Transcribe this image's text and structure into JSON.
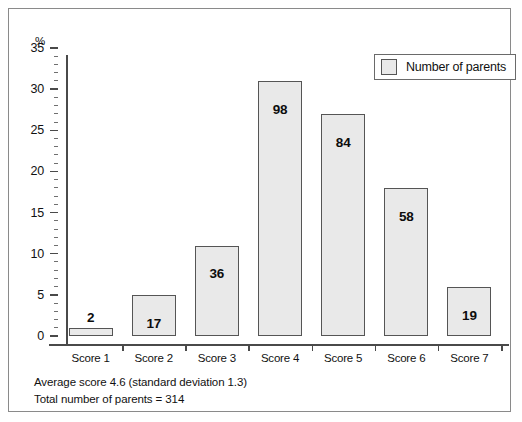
{
  "chart_data": {
    "type": "bar",
    "title": "",
    "subtitle": "",
    "xlabel": "",
    "ylabel": "%",
    "ylim": [
      0,
      35
    ],
    "ytick_step": 5,
    "yminor_step": 1,
    "grid": false,
    "legend_position": "top-right",
    "categories": [
      "Score 1",
      "Score 2",
      "Score 3",
      "Score 4",
      "Score 5",
      "Score 6",
      "Score 7"
    ],
    "yticks": [
      "0",
      "5",
      "10",
      "15",
      "20",
      "25",
      "30",
      "35"
    ],
    "series": [
      {
        "name": "Number of parents",
        "values": [
          1,
          5,
          11,
          31,
          27,
          18,
          6
        ],
        "data_labels": [
          "2",
          "17",
          "36",
          "98",
          "84",
          "58",
          "19"
        ]
      }
    ],
    "annotations": [
      "Average score 4.6 (standard deviation 1.3)",
      "Total number of parents = 314"
    ],
    "colors": {
      "bar_fill": "#e9e9e9",
      "bar_border": "#555555",
      "axis": "#4a4a4a",
      "text": "#111111",
      "frame": "#8a8a8a"
    }
  },
  "legend": {
    "label": "Number of parents"
  },
  "axis": {
    "unit_label": "%"
  },
  "footnotes": {
    "line1": "Average score 4.6 (standard deviation 1.3)",
    "line2": "Total number of parents = 314"
  }
}
